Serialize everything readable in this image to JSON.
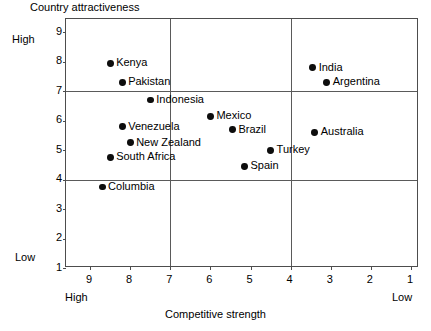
{
  "chart_data": {
    "type": "scatter",
    "title": "",
    "ylabel": "Country attractiveness",
    "xlabel": "Competitive strength",
    "xlim": [
      9.6,
      0.8
    ],
    "ylim": [
      1,
      9.45
    ],
    "x_axis_reversed": true,
    "xticks": [
      9,
      8,
      7,
      6,
      5,
      4,
      3,
      2,
      1
    ],
    "yticks": [
      9,
      8,
      7,
      6,
      5,
      4,
      3,
      2,
      1
    ],
    "axis_endpoint_labels": {
      "y_high": "High",
      "y_low": "Low",
      "x_high": "High",
      "x_low": "Low"
    },
    "grid": {
      "horizontal_lines": [
        7,
        4
      ],
      "vertical_lines": [
        7,
        4
      ],
      "show_outer_frame": true
    },
    "legend": null,
    "points": [
      {
        "label": "Kenya",
        "x": 8.5,
        "y": 7.95,
        "label_side": "right"
      },
      {
        "label": "Pakistan",
        "x": 8.2,
        "y": 7.3,
        "label_side": "right"
      },
      {
        "label": "Indonesia",
        "x": 7.5,
        "y": 6.7,
        "label_side": "right"
      },
      {
        "label": "Venezuela",
        "x": 8.2,
        "y": 5.8,
        "label_side": "right"
      },
      {
        "label": "New Zealand",
        "x": 8.0,
        "y": 5.25,
        "label_side": "right"
      },
      {
        "label": "South Africa",
        "x": 8.5,
        "y": 4.75,
        "label_side": "right"
      },
      {
        "label": "Columbia",
        "x": 8.7,
        "y": 3.75,
        "label_side": "right"
      },
      {
        "label": "Mexico",
        "x": 6.0,
        "y": 6.15,
        "label_side": "right"
      },
      {
        "label": "Brazil",
        "x": 5.45,
        "y": 5.7,
        "label_side": "right"
      },
      {
        "label": "Turkey",
        "x": 4.5,
        "y": 5.0,
        "label_side": "right"
      },
      {
        "label": "Spain",
        "x": 5.15,
        "y": 4.45,
        "label_side": "right"
      },
      {
        "label": "India",
        "x": 3.45,
        "y": 7.8,
        "label_side": "right"
      },
      {
        "label": "Argentina",
        "x": 3.1,
        "y": 7.3,
        "label_side": "right"
      },
      {
        "label": "Australia",
        "x": 3.4,
        "y": 5.6,
        "label_side": "right"
      }
    ],
    "colors": {
      "marker": "#0d0d0d",
      "frame": "#4d4d4d",
      "gridline": "#5a5a5a",
      "text": "#000000",
      "background": "#ffffff"
    }
  }
}
